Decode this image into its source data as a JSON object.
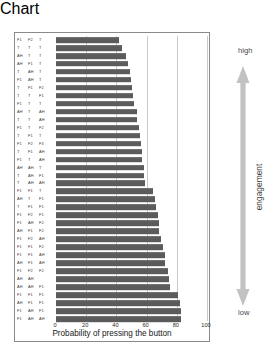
{
  "chart_data": {
    "type": "bar",
    "orientation": "horizontal",
    "title": "",
    "xlabel": "Probability of pressing the button",
    "ylabel": "",
    "xlim": [
      0,
      100
    ],
    "xticks": [
      0,
      20,
      40,
      60,
      80,
      100
    ],
    "grid": true,
    "legend": null,
    "bar_color": "#5b5b5b",
    "sort_order": "ascending top-to-bottom",
    "categories": [
      "F1 F2 T",
      "T T T",
      "AH T T",
      "AH F1 T",
      "T AH T",
      "F1 AH T",
      "T F1 F2",
      "T T F1",
      "F1 T T",
      "AH T AH",
      "T T AH",
      "F1 T F2",
      "T F1 T",
      "F1 F2 F3",
      "T F1 AH",
      "F1 T AH",
      "AH AH T",
      "T AH F1",
      "T AH AH",
      "F1 F1 T",
      "AH T F1",
      "T F1 F1",
      "F1 F2 F1",
      "F1 AH F2",
      "AH F1 F2",
      "F1 F2 AH",
      "F1 F1 F2",
      "F1 F1 AH",
      "AH F1 AH",
      "F1 F2 F2",
      "AH AH",
      "AH AH F1",
      "F1 F1 F1",
      "AH F1 F1",
      "F1 AH F1",
      "F1 AH AH"
    ],
    "values": [
      42,
      44,
      46.5,
      47.5,
      49,
      49.5,
      50.5,
      51,
      51.5,
      53.5,
      53.5,
      55,
      55.5,
      56,
      57,
      57,
      58,
      58,
      59,
      64,
      65.5,
      66,
      67.5,
      68,
      68.5,
      69.5,
      71,
      72.5,
      72.5,
      74.5,
      75,
      75.5,
      81,
      82,
      82.5,
      83
    ]
  },
  "annotations": {
    "high_label": "high",
    "low_label": "low",
    "axis_label": "engagement",
    "arrow_color": "#c2c2c2"
  }
}
